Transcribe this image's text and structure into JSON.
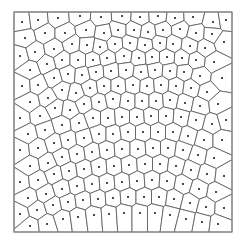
{
  "diagram": {
    "type": "voronoi",
    "bounds": {
      "x0": 14,
      "y0": 12,
      "x1": 232,
      "y1": 232
    },
    "style": {
      "edge_color": "#555555",
      "border_color": "#8a8a8a",
      "seed_color": "#111111",
      "background": "#ffffff"
    },
    "seeds": [
      [
        22,
        22
      ],
      [
        38,
        20
      ],
      [
        58,
        18
      ],
      [
        80,
        16
      ],
      [
        101,
        17
      ],
      [
        122,
        16
      ],
      [
        140,
        17
      ],
      [
        158,
        16
      ],
      [
        175,
        18
      ],
      [
        193,
        17
      ],
      [
        213,
        22
      ],
      [
        226,
        20
      ],
      [
        25,
        38
      ],
      [
        45,
        33
      ],
      [
        65,
        33
      ],
      [
        86,
        30
      ],
      [
        104,
        33
      ],
      [
        118,
        30
      ],
      [
        134,
        30
      ],
      [
        148,
        32
      ],
      [
        163,
        30
      ],
      [
        180,
        29
      ],
      [
        196,
        33
      ],
      [
        212,
        34
      ],
      [
        20,
        56
      ],
      [
        35,
        52
      ],
      [
        54,
        49
      ],
      [
        72,
        44
      ],
      [
        87,
        45
      ],
      [
        100,
        47
      ],
      [
        115,
        44
      ],
      [
        130,
        43
      ],
      [
        145,
        45
      ],
      [
        160,
        43
      ],
      [
        173,
        44
      ],
      [
        190,
        46
      ],
      [
        205,
        48
      ],
      [
        224,
        42
      ],
      [
        30,
        70
      ],
      [
        47,
        64
      ],
      [
        62,
        60
      ],
      [
        78,
        60
      ],
      [
        93,
        60
      ],
      [
        107,
        58
      ],
      [
        124,
        56
      ],
      [
        139,
        58
      ],
      [
        152,
        57
      ],
      [
        167,
        57
      ],
      [
        182,
        58
      ],
      [
        196,
        60
      ],
      [
        214,
        62
      ],
      [
        22,
        86
      ],
      [
        38,
        85
      ],
      [
        54,
        78
      ],
      [
        68,
        74
      ],
      [
        82,
        75
      ],
      [
        96,
        72
      ],
      [
        111,
        71
      ],
      [
        126,
        70
      ],
      [
        141,
        72
      ],
      [
        155,
        70
      ],
      [
        170,
        71
      ],
      [
        184,
        72
      ],
      [
        200,
        76
      ],
      [
        222,
        78
      ],
      [
        30,
        102
      ],
      [
        48,
        98
      ],
      [
        62,
        90
      ],
      [
        76,
        93
      ],
      [
        90,
        88
      ],
      [
        104,
        86
      ],
      [
        118,
        86
      ],
      [
        133,
        85
      ],
      [
        147,
        86
      ],
      [
        161,
        85
      ],
      [
        176,
        86
      ],
      [
        191,
        88
      ],
      [
        207,
        92
      ],
      [
        20,
        118
      ],
      [
        40,
        116
      ],
      [
        55,
        108
      ],
      [
        70,
        110
      ],
      [
        84,
        104
      ],
      [
        99,
        102
      ],
      [
        113,
        99
      ],
      [
        128,
        101
      ],
      [
        142,
        101
      ],
      [
        156,
        101
      ],
      [
        170,
        100
      ],
      [
        185,
        103
      ],
      [
        200,
        106
      ],
      [
        218,
        104
      ],
      [
        28,
        134
      ],
      [
        45,
        130
      ],
      [
        62,
        125
      ],
      [
        79,
        123
      ],
      [
        93,
        118
      ],
      [
        108,
        118
      ],
      [
        122,
        117
      ],
      [
        137,
        117
      ],
      [
        151,
        116
      ],
      [
        166,
        116
      ],
      [
        181,
        117
      ],
      [
        196,
        120
      ],
      [
        212,
        124
      ],
      [
        226,
        120
      ],
      [
        20,
        150
      ],
      [
        38,
        148
      ],
      [
        54,
        143
      ],
      [
        68,
        140
      ],
      [
        84,
        138
      ],
      [
        99,
        134
      ],
      [
        113,
        134
      ],
      [
        128,
        132
      ],
      [
        143,
        132
      ],
      [
        158,
        132
      ],
      [
        173,
        132
      ],
      [
        188,
        136
      ],
      [
        204,
        140
      ],
      [
        222,
        140
      ],
      [
        30,
        166
      ],
      [
        48,
        163
      ],
      [
        62,
        157
      ],
      [
        77,
        154
      ],
      [
        92,
        152
      ],
      [
        107,
        150
      ],
      [
        122,
        149
      ],
      [
        138,
        149
      ],
      [
        153,
        148
      ],
      [
        168,
        148
      ],
      [
        183,
        150
      ],
      [
        198,
        155
      ],
      [
        214,
        158
      ],
      [
        20,
        182
      ],
      [
        38,
        180
      ],
      [
        54,
        174
      ],
      [
        69,
        171
      ],
      [
        84,
        169
      ],
      [
        99,
        167
      ],
      [
        114,
        166
      ],
      [
        129,
        165
      ],
      [
        145,
        164
      ],
      [
        160,
        164
      ],
      [
        176,
        166
      ],
      [
        191,
        170
      ],
      [
        207,
        174
      ],
      [
        224,
        176
      ],
      [
        28,
        198
      ],
      [
        46,
        194
      ],
      [
        62,
        189
      ],
      [
        77,
        186
      ],
      [
        92,
        184
      ],
      [
        107,
        183
      ],
      [
        122,
        182
      ],
      [
        137,
        181
      ],
      [
        152,
        180
      ],
      [
        167,
        181
      ],
      [
        183,
        184
      ],
      [
        199,
        189
      ],
      [
        216,
        192
      ],
      [
        20,
        214
      ],
      [
        37,
        210
      ],
      [
        53,
        205
      ],
      [
        68,
        202
      ],
      [
        83,
        200
      ],
      [
        98,
        199
      ],
      [
        113,
        198
      ],
      [
        128,
        197
      ],
      [
        144,
        197
      ],
      [
        159,
        197
      ],
      [
        174,
        199
      ],
      [
        190,
        203
      ],
      [
        206,
        207
      ],
      [
        224,
        208
      ],
      [
        30,
        226
      ],
      [
        47,
        224
      ],
      [
        63,
        219
      ],
      [
        78,
        217
      ],
      [
        94,
        215
      ],
      [
        109,
        214
      ],
      [
        124,
        213
      ],
      [
        140,
        213
      ],
      [
        155,
        213
      ],
      [
        170,
        215
      ],
      [
        186,
        219
      ],
      [
        202,
        222
      ],
      [
        218,
        224
      ]
    ]
  }
}
